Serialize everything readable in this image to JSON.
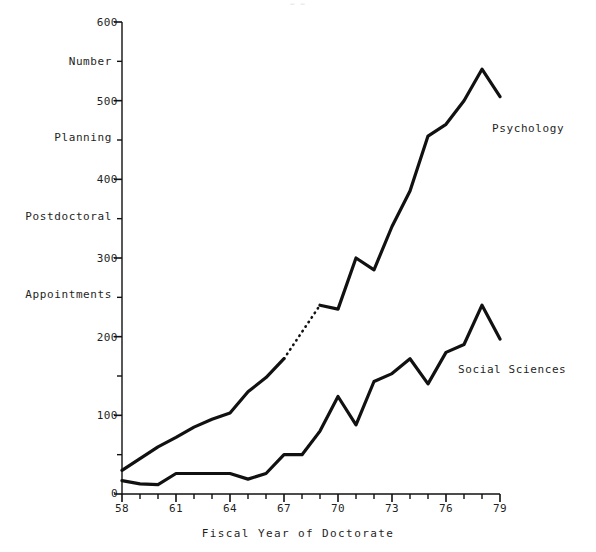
{
  "page": {
    "header_note": "— —"
  },
  "chart_data": {
    "type": "line",
    "title": "",
    "xlabel": "Fiscal Year of Doctorate",
    "ylabel_lines": [
      "Number",
      "Planning",
      "Postdoctoral",
      "Appointments"
    ],
    "xlim": [
      58,
      79
    ],
    "ylim": [
      0,
      600
    ],
    "grid": false,
    "legend_position": "inline-right",
    "x_major_ticks": [
      58,
      61,
      64,
      67,
      70,
      73,
      76,
      79
    ],
    "x_minor_ticks": [
      59,
      60,
      62,
      63,
      65,
      66,
      68,
      69,
      71,
      72,
      74,
      75,
      77,
      78
    ],
    "x_tick_labels": [
      "58",
      "61",
      "64",
      "67",
      "70",
      "73",
      "76",
      "79"
    ],
    "y_major_ticks": [
      0,
      100,
      200,
      300,
      400,
      500,
      600
    ],
    "y_minor_ticks": [
      50,
      150,
      250,
      350,
      450,
      550
    ],
    "y_tick_labels": [
      "0",
      "100",
      "200",
      "300",
      "400",
      "500",
      "600"
    ],
    "x": [
      58,
      59,
      60,
      61,
      62,
      63,
      64,
      65,
      66,
      67,
      68,
      69,
      70,
      71,
      72,
      73,
      74,
      75,
      76,
      77,
      78,
      79
    ],
    "series": [
      {
        "name": "Psychology",
        "label": "Psychology",
        "values": [
          30,
          45,
          60,
          72,
          85,
          95,
          103,
          130,
          148,
          172,
          null,
          240,
          235,
          300,
          285,
          340,
          385,
          455,
          470,
          500,
          540,
          505
        ],
        "dashed_gap": {
          "from_x": 67,
          "from_y": 172,
          "to_x": 69,
          "to_y": 240
        },
        "label_x": 73.6,
        "label_y": 470
      },
      {
        "name": "Social Sciences",
        "label": "Social Sciences",
        "values": [
          17,
          13,
          12,
          26,
          26,
          26,
          26,
          19,
          26,
          50,
          50,
          80,
          124,
          88,
          143,
          153,
          172,
          140,
          180,
          190,
          240,
          197
        ],
        "dashed_gap": {
          "from_x": 68,
          "from_y": 50,
          "to_x": 69,
          "to_y": 80
        },
        "label_x": 74.0,
        "label_y": 160
      }
    ]
  }
}
